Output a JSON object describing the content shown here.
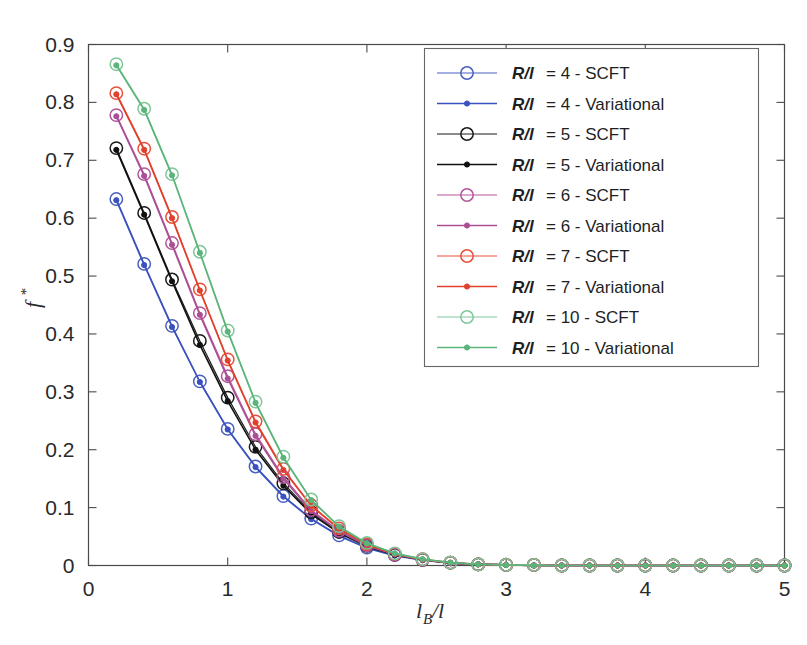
{
  "chart_data": {
    "type": "line",
    "title": "",
    "xlabel": "l_B/l",
    "ylabel": "f*",
    "xlim": [
      0,
      5
    ],
    "ylim": [
      0,
      0.9
    ],
    "xticks": [
      "0",
      "1",
      "2",
      "3",
      "4",
      "5"
    ],
    "xtick_values": [
      0,
      1,
      2,
      3,
      4,
      5
    ],
    "yticks": [
      "0",
      "0.1",
      "0.2",
      "0.3",
      "0.4",
      "0.5",
      "0.6",
      "0.7",
      "0.8",
      "0.9"
    ],
    "ytick_values": [
      0,
      0.1,
      0.2,
      0.3,
      0.4,
      0.5,
      0.6,
      0.7,
      0.8,
      0.9
    ],
    "grid": false,
    "legend_position": "top-right",
    "x": [
      0.2,
      0.4,
      0.6,
      0.8,
      1.0,
      1.2,
      1.4,
      1.6,
      1.8,
      2.0,
      2.2,
      2.4,
      2.6,
      2.8,
      3.0,
      3.2,
      3.4,
      3.6,
      3.8,
      4.0,
      4.2,
      4.4,
      4.6,
      4.8,
      5.0
    ],
    "series": [
      {
        "name": "R/l = 4 - SCFT",
        "label_key": "R/l",
        "label_value": "4",
        "label_method": "SCFT",
        "color": "#4a5fbf",
        "marker": "open-circle",
        "values": [
          0.633,
          0.521,
          0.414,
          0.318,
          0.236,
          0.171,
          0.12,
          0.081,
          0.052,
          0.031,
          0.018,
          0.01,
          0.005,
          0.002,
          0.001,
          0.001,
          0.0,
          0.0,
          0.0,
          0.0,
          0.0,
          0.0,
          0.0,
          0.0,
          0.0
        ]
      },
      {
        "name": "R/l = 4 - Variational",
        "label_key": "R/l",
        "label_value": "4",
        "label_method": "Variational",
        "color": "#3a52c0",
        "marker": "filled-dot",
        "values": [
          0.631,
          0.519,
          0.412,
          0.317,
          0.235,
          0.17,
          0.119,
          0.08,
          0.051,
          0.03,
          0.017,
          0.009,
          0.004,
          0.002,
          0.001,
          0.0,
          0.0,
          0.0,
          0.0,
          0.0,
          0.0,
          0.0,
          0.0,
          0.0,
          0.0
        ]
      },
      {
        "name": "R/l = 5 - SCFT",
        "label_key": "R/l",
        "label_value": "5",
        "label_method": "SCFT",
        "color": "#1a1a1a",
        "marker": "open-circle",
        "values": [
          0.721,
          0.609,
          0.494,
          0.388,
          0.29,
          0.205,
          0.142,
          0.092,
          0.058,
          0.034,
          0.019,
          0.01,
          0.005,
          0.002,
          0.001,
          0.001,
          0.0,
          0.0,
          0.0,
          0.0,
          0.0,
          0.0,
          0.0,
          0.0,
          0.0
        ]
      },
      {
        "name": "R/l = 5 - Variational",
        "label_key": "R/l",
        "label_value": "5",
        "label_method": "Variational",
        "color": "#111111",
        "marker": "filled-dot",
        "values": [
          0.718,
          0.606,
          0.491,
          0.381,
          0.284,
          0.2,
          0.138,
          0.089,
          0.056,
          0.033,
          0.018,
          0.01,
          0.004,
          0.002,
          0.001,
          0.0,
          0.0,
          0.0,
          0.0,
          0.0,
          0.0,
          0.0,
          0.0,
          0.0,
          0.0
        ]
      },
      {
        "name": "R/l = 6 - SCFT",
        "label_key": "R/l",
        "label_value": "6",
        "label_method": "SCFT",
        "color": "#b5559a",
        "marker": "open-circle",
        "values": [
          0.778,
          0.676,
          0.557,
          0.436,
          0.327,
          0.227,
          0.153,
          0.096,
          0.06,
          0.035,
          0.019,
          0.01,
          0.005,
          0.002,
          0.001,
          0.001,
          0.0,
          0.0,
          0.0,
          0.0,
          0.0,
          0.0,
          0.0,
          0.0,
          0.0
        ]
      },
      {
        "name": "R/l = 6 - Variational",
        "label_key": "R/l",
        "label_value": "6",
        "label_method": "Variational",
        "color": "#aa4f95",
        "marker": "filled-dot",
        "values": [
          0.776,
          0.673,
          0.554,
          0.433,
          0.323,
          0.224,
          0.15,
          0.094,
          0.059,
          0.034,
          0.019,
          0.01,
          0.004,
          0.002,
          0.001,
          0.0,
          0.0,
          0.0,
          0.0,
          0.0,
          0.0,
          0.0,
          0.0,
          0.0,
          0.0
        ]
      },
      {
        "name": "R/l = 7 - SCFT",
        "label_key": "R/l",
        "label_value": "7",
        "label_method": "SCFT",
        "color": "#e8503a",
        "marker": "open-circle",
        "values": [
          0.816,
          0.72,
          0.602,
          0.477,
          0.356,
          0.249,
          0.167,
          0.104,
          0.064,
          0.037,
          0.02,
          0.011,
          0.005,
          0.002,
          0.001,
          0.001,
          0.0,
          0.0,
          0.0,
          0.0,
          0.0,
          0.0,
          0.0,
          0.0,
          0.0
        ]
      },
      {
        "name": "R/l = 7 - Variational",
        "label_key": "R/l",
        "label_value": "7",
        "label_method": "Variational",
        "color": "#e0402c",
        "marker": "filled-dot",
        "values": [
          0.814,
          0.718,
          0.6,
          0.475,
          0.354,
          0.247,
          0.165,
          0.103,
          0.063,
          0.036,
          0.02,
          0.01,
          0.005,
          0.002,
          0.001,
          0.0,
          0.0,
          0.0,
          0.0,
          0.0,
          0.0,
          0.0,
          0.0,
          0.0,
          0.0
        ]
      },
      {
        "name": "R/l = 10 - SCFT",
        "label_key": "R/l",
        "label_value": "10",
        "label_method": "SCFT",
        "color": "#7fc79a",
        "marker": "open-circle",
        "values": [
          0.866,
          0.789,
          0.676,
          0.542,
          0.406,
          0.283,
          0.188,
          0.114,
          0.068,
          0.039,
          0.021,
          0.011,
          0.005,
          0.002,
          0.001,
          0.001,
          0.0,
          0.0,
          0.0,
          0.0,
          0.0,
          0.0,
          0.0,
          0.0,
          0.0
        ]
      },
      {
        "name": "R/l = 10 - Variational",
        "label_key": "R/l",
        "label_value": "10",
        "label_method": "Variational",
        "color": "#5bb47a",
        "marker": "filled-dot",
        "values": [
          0.864,
          0.787,
          0.674,
          0.54,
          0.404,
          0.281,
          0.186,
          0.113,
          0.067,
          0.038,
          0.021,
          0.011,
          0.005,
          0.002,
          0.001,
          0.0,
          0.0,
          0.0,
          0.0,
          0.0,
          0.0,
          0.0,
          0.0,
          0.0,
          0.0
        ]
      }
    ]
  },
  "axes": {
    "y_label_main": "f",
    "y_label_sup": "*",
    "x_label_main": "l",
    "x_label_sub": "B",
    "x_label_tail": "/l"
  }
}
